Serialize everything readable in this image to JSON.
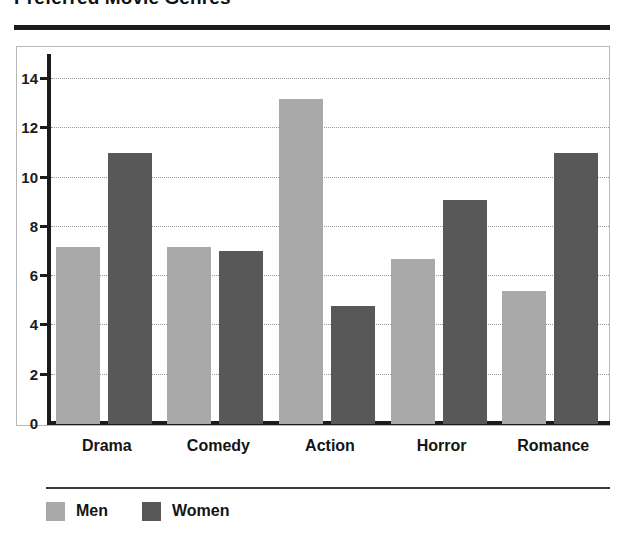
{
  "chart_data": {
    "type": "bar",
    "title": "Preferred Movie Genres",
    "xlabel": "",
    "ylabel": "",
    "ylim": [
      0,
      15
    ],
    "yticks": [
      0,
      2,
      4,
      6,
      8,
      10,
      12,
      14
    ],
    "grid": true,
    "legend_position": "bottom-left",
    "categories": [
      "Drama",
      "Comedy",
      "Action",
      "Horror",
      "Romance"
    ],
    "series": [
      {
        "name": "Men",
        "color": "#a9a9a9",
        "values": [
          7.2,
          7.2,
          13.2,
          6.7,
          5.4
        ]
      },
      {
        "name": "Women",
        "color": "#585858",
        "values": [
          11.0,
          7.0,
          4.8,
          9.1,
          11.0
        ]
      }
    ]
  },
  "axis": {
    "tick_labels": [
      "0",
      "2",
      "4",
      "6",
      "8",
      "10",
      "12",
      "14"
    ]
  },
  "legend": {
    "items": [
      {
        "label": "Men",
        "color": "#a9a9a9"
      },
      {
        "label": "Women",
        "color": "#585858"
      }
    ]
  },
  "colors": {
    "men": "#a9a9a9",
    "women": "#585858",
    "axis": "#1b1b1b",
    "grid": "#9a9a9a",
    "frame": "#b8b8b8",
    "rule": "#1b1b1b",
    "background": "#ffffff"
  }
}
